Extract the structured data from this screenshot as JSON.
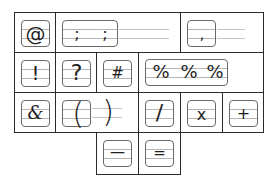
{
  "worksheet": {
    "title": "Punctuation and symbol writing practice",
    "rows": [
      {
        "cells": [
          {
            "id": "at",
            "symbols": [
              "@"
            ]
          },
          {
            "id": "semicolon",
            "symbols": [
              ";",
              ";"
            ]
          },
          {
            "id": "comma",
            "symbols": [
              ","
            ]
          }
        ]
      },
      {
        "cells": [
          {
            "id": "exclamation",
            "symbols": [
              "!"
            ]
          },
          {
            "id": "question",
            "symbols": [
              "?"
            ]
          },
          {
            "id": "hash",
            "symbols": [
              "#"
            ]
          },
          {
            "id": "percent",
            "symbols": [
              "%",
              "%",
              "%"
            ]
          }
        ]
      },
      {
        "cells": [
          {
            "id": "ampersand",
            "symbols": [
              "&"
            ]
          },
          {
            "id": "parentheses",
            "symbols": [
              "(",
              ")"
            ]
          },
          {
            "id": "slash",
            "symbols": [
              "/"
            ]
          },
          {
            "id": "multiply",
            "symbols": [
              "x"
            ]
          },
          {
            "id": "plus",
            "symbols": [
              "+"
            ]
          }
        ]
      },
      {
        "cells": [
          {
            "id": "dash",
            "symbols": [
              "—"
            ]
          },
          {
            "id": "equals",
            "symbols": [
              "="
            ]
          }
        ]
      }
    ]
  },
  "colors": {
    "grid": "#2a2a2a",
    "card": "#6a6a6a",
    "guide": "#b5b5b5",
    "ink": "#1e1e1e"
  }
}
